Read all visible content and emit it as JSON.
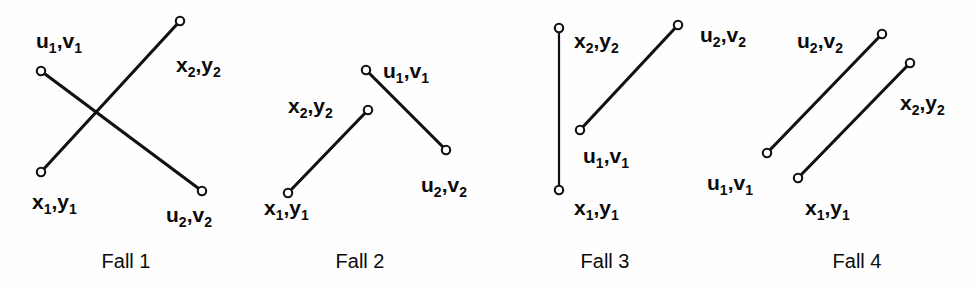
{
  "figure": {
    "background_color": "#fefefe",
    "line_color": "#111111",
    "label_color": "#0b0b0b",
    "endpoint_style": "open-circle"
  },
  "cases": [
    {
      "id": "fall-1",
      "caption": "Fall 1",
      "caption_x": 126,
      "caption_y": 268,
      "segments": [
        {
          "name": "segment-x",
          "from": {
            "label": "x",
            "x": 41,
            "y": 172
          },
          "to": {
            "label": "x",
            "x": 180,
            "y": 21
          },
          "stroke_width": 3.1
        },
        {
          "name": "segment-u",
          "from": {
            "label": "u",
            "x": 41,
            "y": 71
          },
          "to": {
            "label": "u",
            "x": 202,
            "y": 191
          },
          "stroke_width": 3.1
        }
      ],
      "labels": [
        {
          "name": "label-u1v1",
          "base": "u",
          "sub1": "1",
          "base2": "v",
          "sub2": "1",
          "x": 36,
          "y": 48,
          "anchor": "start"
        },
        {
          "name": "label-x2y2",
          "base": "x",
          "sub1": "2",
          "base2": "y",
          "sub2": "2",
          "x": 176,
          "y": 72,
          "anchor": "start"
        },
        {
          "name": "label-x1y1",
          "base": "x",
          "sub1": "1",
          "base2": "y",
          "sub2": "1",
          "x": 32,
          "y": 209,
          "anchor": "start"
        },
        {
          "name": "label-u2v2",
          "base": "u",
          "sub1": "2",
          "base2": "v",
          "sub2": "2",
          "x": 166,
          "y": 222,
          "anchor": "start"
        }
      ]
    },
    {
      "id": "fall-2",
      "caption": "Fall 2",
      "caption_x": 360,
      "caption_y": 268,
      "segments": [
        {
          "name": "segment-x",
          "from": {
            "label": "x",
            "x": 288,
            "y": 193
          },
          "to": {
            "label": "x",
            "x": 368,
            "y": 110
          },
          "stroke_width": 3.1
        },
        {
          "name": "segment-u",
          "from": {
            "label": "u",
            "x": 366,
            "y": 70
          },
          "to": {
            "label": "u",
            "x": 446,
            "y": 150
          },
          "stroke_width": 3.1
        }
      ],
      "labels": [
        {
          "name": "label-u1v1",
          "base": "u",
          "sub1": "1",
          "base2": "v",
          "sub2": "1",
          "x": 383,
          "y": 78,
          "anchor": "start"
        },
        {
          "name": "label-x2y2",
          "base": "x",
          "sub1": "2",
          "base2": "y",
          "sub2": "2",
          "x": 288,
          "y": 113,
          "anchor": "start"
        },
        {
          "name": "label-x1y1",
          "base": "x",
          "sub1": "1",
          "base2": "y",
          "sub2": "1",
          "x": 264,
          "y": 215,
          "anchor": "start"
        },
        {
          "name": "label-u2v2",
          "base": "u",
          "sub1": "2",
          "base2": "v",
          "sub2": "2",
          "x": 421,
          "y": 192,
          "anchor": "start"
        }
      ]
    },
    {
      "id": "fall-3",
      "caption": "Fall 3",
      "caption_x": 605,
      "caption_y": 268,
      "segments": [
        {
          "name": "segment-x",
          "from": {
            "label": "x",
            "x": 559,
            "y": 190
          },
          "to": {
            "label": "x",
            "x": 559,
            "y": 28
          },
          "stroke_width": 2.2
        },
        {
          "name": "segment-u",
          "from": {
            "label": "u",
            "x": 580,
            "y": 130
          },
          "to": {
            "label": "u",
            "x": 678,
            "y": 25
          },
          "stroke_width": 3.1
        }
      ],
      "labels": [
        {
          "name": "label-x2y2",
          "base": "x",
          "sub1": "2",
          "base2": "y",
          "sub2": "2",
          "x": 574,
          "y": 48,
          "anchor": "start"
        },
        {
          "name": "label-u2v2",
          "base": "u",
          "sub1": "2",
          "base2": "v",
          "sub2": "2",
          "x": 700,
          "y": 42,
          "anchor": "start"
        },
        {
          "name": "label-u1v1",
          "base": "u",
          "sub1": "1",
          "base2": "v",
          "sub2": "1",
          "x": 583,
          "y": 163,
          "anchor": "start"
        },
        {
          "name": "label-x1y1",
          "base": "x",
          "sub1": "1",
          "base2": "y",
          "sub2": "1",
          "x": 574,
          "y": 215,
          "anchor": "start"
        }
      ]
    },
    {
      "id": "fall-4",
      "caption": "Fall 4",
      "caption_x": 857,
      "caption_y": 268,
      "segments": [
        {
          "name": "segment-u",
          "from": {
            "label": "u",
            "x": 767,
            "y": 153
          },
          "to": {
            "label": "u",
            "x": 882,
            "y": 34
          },
          "stroke_width": 3.1
        },
        {
          "name": "segment-x",
          "from": {
            "label": "x",
            "x": 798,
            "y": 178
          },
          "to": {
            "label": "x",
            "x": 910,
            "y": 63
          },
          "stroke_width": 3.1
        }
      ],
      "labels": [
        {
          "name": "label-u2v2",
          "base": "u",
          "sub1": "2",
          "base2": "v",
          "sub2": "2",
          "x": 797,
          "y": 48,
          "anchor": "start"
        },
        {
          "name": "label-x2y2",
          "base": "x",
          "sub1": "2",
          "base2": "y",
          "sub2": "2",
          "x": 900,
          "y": 110,
          "anchor": "start"
        },
        {
          "name": "label-u1v1",
          "base": "u",
          "sub1": "1",
          "base2": "v",
          "sub2": "1",
          "x": 707,
          "y": 190,
          "anchor": "start"
        },
        {
          "name": "label-x1y1",
          "base": "x",
          "sub1": "1",
          "base2": "y",
          "sub2": "1",
          "x": 805,
          "y": 215,
          "anchor": "start"
        }
      ]
    }
  ]
}
